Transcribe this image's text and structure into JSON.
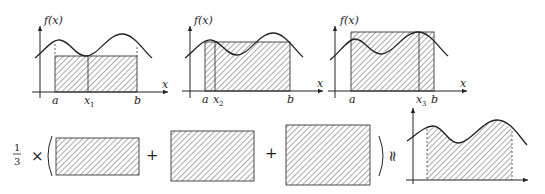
{
  "panels": [
    {
      "id": "panel-1",
      "y_label": "f(x)",
      "x_label": "x",
      "ticks": [
        {
          "label": "a",
          "sub": ""
        },
        {
          "label": "x",
          "sub": "1"
        },
        {
          "label": "b",
          "sub": ""
        }
      ],
      "description": "Rectangle with height f(x1), x1 at curve minimum"
    },
    {
      "id": "panel-2",
      "y_label": "f(x)",
      "x_label": "x",
      "ticks": [
        {
          "label": "a",
          "sub": ""
        },
        {
          "label": "x",
          "sub": "2"
        },
        {
          "label": "b",
          "sub": ""
        }
      ],
      "description": "Rectangle with height f(x2), x2 near first peak"
    },
    {
      "id": "panel-3",
      "y_label": "f(x)",
      "x_label": "x",
      "ticks": [
        {
          "label": "a",
          "sub": ""
        },
        {
          "label": "x",
          "sub": "3"
        },
        {
          "label": "b",
          "sub": ""
        }
      ],
      "description": "Rectangle with height f(x3), x3 at curve maximum"
    }
  ],
  "equation": {
    "coefficient_num": "1",
    "coefficient_den": "3",
    "times": "×",
    "open_paren": "(",
    "plus_1": "+",
    "plus_2": "+",
    "close_paren": ")",
    "approx": "≈"
  },
  "colors": {
    "line": "#222222",
    "hatch": "#444444",
    "background": "#ffffff"
  }
}
